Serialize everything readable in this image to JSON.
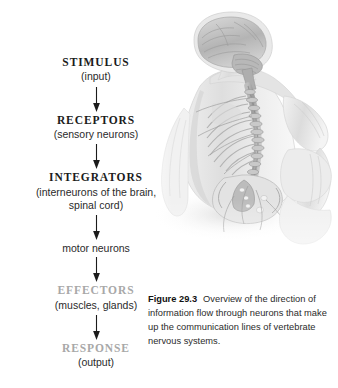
{
  "figure": {
    "number_label": "Figure 29.3",
    "caption_text": "Overview of the direction of information flow through neurons that make up the communication lines of vertebrate nervous systems."
  },
  "illustration": {
    "alt_name": "seated-human-back-view-nervous-system",
    "description": "Grayscale pencil illustration of a seated human figure viewed from behind, showing the brain, spinal cord, rib cage, pelvis and peripheral nerves"
  },
  "flow": {
    "nodes": [
      {
        "title": "STIMULUS",
        "sub": "(input)",
        "style": "dark",
        "type": "titled"
      },
      {
        "title": "RECEPTORS",
        "sub": "(sensory neurons)",
        "style": "dark",
        "type": "titled"
      },
      {
        "title": "INTEGRATORS",
        "sub": "(interneurons of the brain,\nspinal cord)",
        "style": "dark",
        "type": "titled"
      },
      {
        "title": "motor neurons",
        "sub": "",
        "style": "plain",
        "type": "plain"
      },
      {
        "title": "EFFECTORS",
        "sub": "(muscles, glands)",
        "style": "light",
        "type": "titled"
      },
      {
        "title": "RESPONSE",
        "sub": "(output)",
        "style": "light",
        "type": "titled"
      }
    ],
    "arrow_count": 5,
    "arrow_direction": "down"
  },
  "colors": {
    "text_dark": "#1b1b1b",
    "text_body": "#2a2a2a",
    "text_dim": "#a8a8a8",
    "arrow": "#1b1b1b",
    "background": "#ffffff",
    "art_gray_light": "#e8e8e8",
    "art_gray_mid": "#c6c6c6",
    "art_gray_dark": "#9a9a9a"
  }
}
